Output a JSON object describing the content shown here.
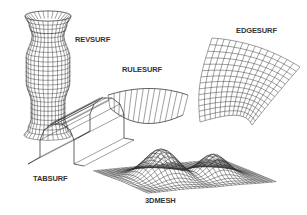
{
  "figure": {
    "labels": {
      "revsurf": "REVSURF",
      "edgesurf": "EDGESURF",
      "rulesurf": "RULESURF",
      "tabsurf": "TABSURF",
      "mesh3d": "3DMESH"
    },
    "colors": {
      "background": "#ffffff",
      "line": "#2a2a2a",
      "text": "#333333"
    }
  }
}
